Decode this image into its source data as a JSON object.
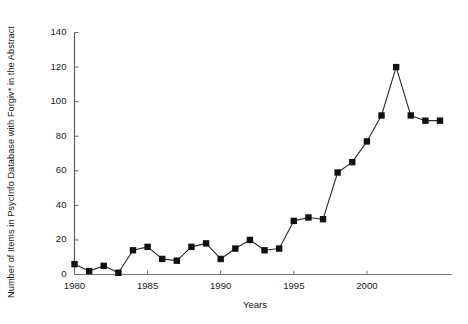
{
  "chart_data": {
    "type": "line",
    "title": "",
    "xlabel": "Years",
    "ylabel": "Number of Items in PsycInfo Database with Forgiv* in the Abstract",
    "xlim": [
      1979.2,
      2005.6
    ],
    "ylim": [
      0,
      140
    ],
    "grid": false,
    "legend": "none",
    "marker": "square",
    "marker_color": "#111111",
    "line_color": "#2b2b2b",
    "x": [
      1980,
      1981,
      1982,
      1983,
      1984,
      1985,
      1986,
      1987,
      1988,
      1989,
      1990,
      1991,
      1992,
      1993,
      1994,
      1995,
      1996,
      1997,
      1998,
      1999,
      2000,
      2001,
      2002,
      2003,
      2004,
      2005
    ],
    "values": [
      6,
      2,
      5,
      1,
      14,
      16,
      9,
      8,
      16,
      18,
      9,
      15,
      20,
      14,
      15,
      31,
      33,
      32,
      59,
      65,
      77,
      92,
      120,
      92,
      89,
      89
    ],
    "xticks": [
      1980,
      1985,
      1990,
      1995,
      2000
    ],
    "xtick_labels": [
      "1980",
      "1985",
      "1990",
      "1995",
      "2000"
    ],
    "yticks": [
      0,
      20,
      40,
      60,
      80,
      100,
      120,
      140
    ],
    "ytick_labels": [
      "0",
      "20",
      "40",
      "60",
      "80",
      "100",
      "120",
      "140"
    ]
  }
}
